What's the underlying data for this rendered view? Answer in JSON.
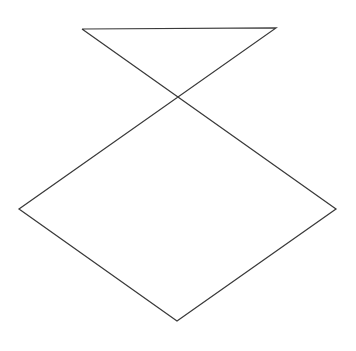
{
  "figure": {
    "shape_name": "pentagram",
    "background_color": "#ffffff",
    "stroke_color": "#3a3a3a",
    "stroke_width": 1.25,
    "canvas": {
      "width": 356,
      "height": 351
    }
  },
  "chart_data": {
    "type": "line",
    "xlabel": "",
    "ylabel": "",
    "grid": false,
    "legend": null,
    "xlim": [
      0,
      356
    ],
    "ylim": [
      0,
      351
    ],
    "series": [
      {
        "name": "star-outline",
        "closed": true,
        "color": "#3a3a3a",
        "points": [
          [
            82,
            29
          ],
          [
            336,
            209
          ],
          [
            177,
            321
          ],
          [
            19,
            209
          ],
          [
            276,
            28
          ],
          [
            82,
            29
          ]
        ]
      }
    ],
    "vertices": {
      "top_left_point": [
        82,
        29
      ],
      "top_right_point": [
        276,
        28
      ],
      "right_point": [
        336,
        209
      ],
      "left_point": [
        19,
        209
      ],
      "bottom_point": [
        177,
        321
      ]
    },
    "intersections": [
      [
        178,
        100
      ],
      [
        117,
        141
      ],
      [
        236,
        141
      ],
      [
        141,
        209
      ],
      [
        214,
        209
      ]
    ]
  }
}
